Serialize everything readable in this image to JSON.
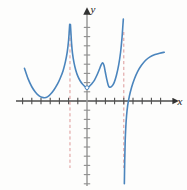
{
  "figure": {
    "kind": "cartesian-graph",
    "background_color": "#fdfdfc",
    "width": 187,
    "height": 190
  },
  "axes": {
    "x_label": "x",
    "y_label": "y",
    "axis_color": "#4d4d4d",
    "tick_color": "#4d4d4d",
    "x_axis_pixel_y": 101,
    "y_axis_pixel_x": 87,
    "x_axis_start": 16,
    "x_axis_end": 173,
    "y_axis_start": 14,
    "y_axis_end": 186,
    "unit_px": 9.2,
    "x_tick_count_left": 8,
    "x_tick_count_right": 9,
    "y_tick_count_up": 8,
    "y_tick_count_down": 9,
    "x_arrow": true,
    "y_arrow": true
  },
  "chart_data": {
    "type": "line",
    "title": "",
    "xlabel": "x",
    "ylabel": "y",
    "grid": false,
    "legend": null,
    "xlim": [
      -7.7,
      9.3
    ],
    "ylim": [
      -9.2,
      9.4
    ],
    "asymptotes": [
      {
        "type": "vertical",
        "x": -1.85,
        "style": "dashed",
        "color": "#d98d8d"
      },
      {
        "type": "vertical",
        "x": 4.0,
        "style": "dashed",
        "color": "#d98d8d"
      }
    ],
    "features": [
      {
        "type": "open-point",
        "x": 0.0,
        "y": 1.45,
        "note": "small open circle at local minimum on y-axis"
      },
      {
        "type": "local-minimum",
        "x": -4.6,
        "y": 0.35
      },
      {
        "type": "local-minimum",
        "x": 2.45,
        "y": 1.5
      },
      {
        "type": "local-maximum",
        "x": 1.7,
        "y": 4.15
      },
      {
        "type": "branch-end-left",
        "x": -6.8,
        "y": 3.55
      },
      {
        "type": "branch-end-right",
        "x": 8.4,
        "y": 5.3
      }
    ],
    "series": [
      {
        "name": "branch-left",
        "color": "#4b85bd",
        "points": [
          [
            -6.8,
            3.55
          ],
          [
            -6.4,
            2.4
          ],
          [
            -6.0,
            1.55
          ],
          [
            -5.6,
            0.95
          ],
          [
            -5.2,
            0.55
          ],
          [
            -4.9,
            0.4
          ],
          [
            -4.6,
            0.35
          ],
          [
            -4.3,
            0.45
          ],
          [
            -4.0,
            0.7
          ],
          [
            -3.6,
            1.2
          ],
          [
            -3.2,
            1.85
          ],
          [
            -2.9,
            2.5
          ],
          [
            -2.6,
            3.3
          ],
          [
            -2.35,
            4.25
          ],
          [
            -2.15,
            5.3
          ],
          [
            -2.0,
            6.6
          ],
          [
            -1.93,
            7.6
          ],
          [
            -1.88,
            8.35
          ]
        ]
      },
      {
        "name": "branch-middle",
        "color": "#4b85bd",
        "points": [
          [
            -1.8,
            8.3
          ],
          [
            -1.74,
            7.3
          ],
          [
            -1.68,
            6.3
          ],
          [
            -1.58,
            5.2
          ],
          [
            -1.42,
            4.2
          ],
          [
            -1.22,
            3.35
          ],
          [
            -1.0,
            2.7
          ],
          [
            -0.75,
            2.2
          ],
          [
            -0.5,
            1.85
          ],
          [
            -0.25,
            1.6
          ],
          [
            0.0,
            1.45
          ],
          [
            0.25,
            1.6
          ],
          [
            0.5,
            1.85
          ],
          [
            0.8,
            2.25
          ],
          [
            1.1,
            2.85
          ],
          [
            1.35,
            3.45
          ],
          [
            1.55,
            3.95
          ],
          [
            1.7,
            4.15
          ],
          [
            1.85,
            3.85
          ],
          [
            2.0,
            3.1
          ],
          [
            2.15,
            2.35
          ],
          [
            2.3,
            1.75
          ],
          [
            2.45,
            1.5
          ],
          [
            2.7,
            1.6
          ],
          [
            2.95,
            2.0
          ],
          [
            3.2,
            2.8
          ],
          [
            3.45,
            3.95
          ],
          [
            3.65,
            5.3
          ],
          [
            3.8,
            6.8
          ],
          [
            3.9,
            8.2
          ],
          [
            3.95,
            8.9
          ]
        ]
      },
      {
        "name": "branch-right",
        "color": "#4b85bd",
        "points": [
          [
            4.06,
            -9.0
          ],
          [
            4.1,
            -6.5
          ],
          [
            4.15,
            -4.4
          ],
          [
            4.22,
            -2.8
          ],
          [
            4.3,
            -1.6
          ],
          [
            4.42,
            -0.5
          ],
          [
            4.6,
            0.5
          ],
          [
            4.85,
            1.5
          ],
          [
            5.15,
            2.4
          ],
          [
            5.5,
            3.2
          ],
          [
            5.9,
            3.85
          ],
          [
            6.35,
            4.4
          ],
          [
            6.85,
            4.8
          ],
          [
            7.4,
            5.05
          ],
          [
            7.9,
            5.2
          ],
          [
            8.4,
            5.3
          ]
        ]
      }
    ],
    "curve_color": "#4b85bd",
    "curve_width": 1.6
  }
}
